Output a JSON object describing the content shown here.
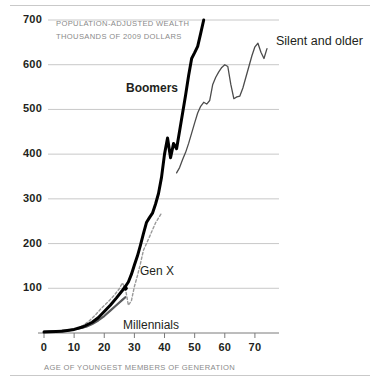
{
  "chart_data": {
    "type": "line",
    "title": "",
    "unit_note_line1": "POPULATION-ADJUSTED WEALTH",
    "unit_note_line2": "THOUSANDS OF 2009 DOLLARS",
    "xlabel": "AGE OF YOUNGEST MEMBERS OF GENERATION",
    "ylabel": "",
    "xlim": [
      0,
      76
    ],
    "ylim": [
      0,
      700
    ],
    "grid": "horizontal",
    "legend": "inline-labels",
    "yticks": [
      100,
      200,
      300,
      400,
      500,
      600,
      700
    ],
    "ytick_labels": [
      "100",
      "200",
      "300",
      "400",
      "500",
      "600",
      "700"
    ],
    "xticks": [
      0,
      10,
      20,
      30,
      40,
      50,
      60,
      70
    ],
    "xtick_labels": [
      "0",
      "10",
      "20",
      "30",
      "40",
      "50",
      "60",
      "70"
    ],
    "series": [
      {
        "name": "Millennials",
        "label": "Millennials",
        "style": "solid",
        "color": "#58595b",
        "width": 2.2,
        "points": [
          [
            0,
            3
          ],
          [
            4,
            4
          ],
          [
            8,
            6
          ],
          [
            11,
            9
          ],
          [
            14,
            14
          ],
          [
            16,
            20
          ],
          [
            18,
            28
          ],
          [
            20,
            38
          ],
          [
            22,
            50
          ],
          [
            24,
            62
          ],
          [
            26,
            74
          ],
          [
            27,
            80
          ]
        ]
      },
      {
        "name": "Gen X",
        "label": "Gen X",
        "style": "dashed",
        "color": "#9a9a9a",
        "width": 1.4,
        "points": [
          [
            8,
            5
          ],
          [
            11,
            10
          ],
          [
            13,
            17
          ],
          [
            15,
            27
          ],
          [
            17,
            40
          ],
          [
            19,
            55
          ],
          [
            21,
            68
          ],
          [
            23,
            82
          ],
          [
            25,
            99
          ],
          [
            26,
            112
          ],
          [
            27,
            100
          ],
          [
            28,
            62
          ],
          [
            29,
            72
          ],
          [
            30,
            104
          ],
          [
            31,
            128
          ],
          [
            32,
            155
          ],
          [
            33,
            185
          ],
          [
            35,
            215
          ],
          [
            37,
            246
          ],
          [
            39,
            268
          ]
        ]
      },
      {
        "name": "Boomers",
        "label": "Boomers",
        "style": "solid",
        "color": "#000000",
        "width": 3.0,
        "points": [
          [
            0,
            2
          ],
          [
            6,
            4
          ],
          [
            10,
            8
          ],
          [
            13,
            14
          ],
          [
            16,
            24
          ],
          [
            18,
            34
          ],
          [
            20,
            48
          ],
          [
            22,
            62
          ],
          [
            24,
            78
          ],
          [
            26,
            95
          ],
          [
            27,
            104
          ],
          [
            28,
            114
          ],
          [
            29,
            131
          ],
          [
            30,
            152
          ],
          [
            31,
            172
          ],
          [
            32,
            196
          ],
          [
            33,
            222
          ],
          [
            34,
            247
          ],
          [
            35,
            258
          ],
          [
            36,
            268
          ],
          [
            37,
            288
          ],
          [
            38,
            312
          ],
          [
            39,
            348
          ],
          [
            40,
            400
          ],
          [
            41,
            436
          ],
          [
            42,
            392
          ],
          [
            43,
            424
          ],
          [
            44,
            412
          ],
          [
            45,
            452
          ],
          [
            46,
            492
          ],
          [
            47,
            532
          ],
          [
            48,
            576
          ],
          [
            49,
            614
          ],
          [
            50,
            627
          ],
          [
            51,
            641
          ],
          [
            52,
            670
          ],
          [
            53,
            700
          ]
        ]
      },
      {
        "name": "Silent and older",
        "label": "Silent and older",
        "style": "solid",
        "color": "#4c4c4c",
        "width": 1.3,
        "points": [
          [
            44,
            358
          ],
          [
            45,
            370
          ],
          [
            46,
            388
          ],
          [
            47,
            404
          ],
          [
            48,
            424
          ],
          [
            49,
            447
          ],
          [
            50,
            470
          ],
          [
            51,
            492
          ],
          [
            52,
            507
          ],
          [
            53,
            516
          ],
          [
            54,
            512
          ],
          [
            55,
            520
          ],
          [
            56,
            556
          ],
          [
            57,
            572
          ],
          [
            58,
            584
          ],
          [
            59,
            594
          ],
          [
            60,
            600
          ],
          [
            61,
            596
          ],
          [
            62,
            556
          ],
          [
            63,
            524
          ],
          [
            64,
            528
          ],
          [
            65,
            530
          ],
          [
            66,
            548
          ],
          [
            67,
            572
          ],
          [
            68,
            596
          ],
          [
            69,
            620
          ],
          [
            70,
            640
          ],
          [
            71,
            648
          ],
          [
            72,
            628
          ],
          [
            73,
            614
          ],
          [
            74,
            636
          ]
        ]
      }
    ]
  }
}
